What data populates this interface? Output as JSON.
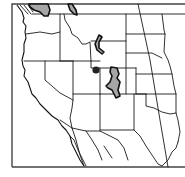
{
  "map": {
    "type": "species range map",
    "region": "Western United States",
    "colors": {
      "background": "#ffffff",
      "state_border": "#1a1a1a",
      "frame": "#444444",
      "range_fill": "#a6a6a6",
      "range_outline": "#111111",
      "point_record": "#222222"
    },
    "ranges": [
      {
        "id": "range-northwest-coast",
        "description": "northern Washington / Cascades"
      },
      {
        "id": "range-north-idaho",
        "description": "northern Idaho"
      },
      {
        "id": "range-wyoming",
        "description": "western Wyoming"
      },
      {
        "id": "range-colorado",
        "description": "central Colorado"
      }
    ],
    "points": [
      {
        "id": "point-northeast-utah",
        "description": "isolated record, NE Utah"
      }
    ]
  }
}
